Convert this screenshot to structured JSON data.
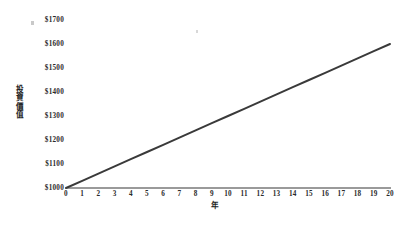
{
  "chart_data": {
    "type": "line",
    "title": "",
    "subtitle": "",
    "xlabel": "年",
    "ylabel": "投資價值",
    "ylabel_chars": [
      "投",
      "資",
      "價",
      "值"
    ],
    "x": [
      0,
      1,
      2,
      3,
      4,
      5,
      6,
      7,
      8,
      9,
      10,
      11,
      12,
      13,
      14,
      15,
      16,
      17,
      18,
      19,
      20
    ],
    "series": [
      {
        "name": "投資價值",
        "color": "#3a3a3a",
        "values": [
          1000,
          1030,
          1060,
          1090,
          1120,
          1150,
          1180,
          1210,
          1240,
          1270,
          1300,
          1330,
          1360,
          1390,
          1420,
          1450,
          1480,
          1510,
          1540,
          1570,
          1600
        ]
      }
    ],
    "x_tick_labels": [
      "0",
      "1",
      "2",
      "3",
      "4",
      "5",
      "6",
      "7",
      "8",
      "9",
      "10",
      "11",
      "12",
      "13",
      "14",
      "15",
      "16",
      "17",
      "18",
      "19",
      "20"
    ],
    "y_tick_labels": [
      "$1700",
      "$1600",
      "$1500",
      "$1400",
      "$1300",
      "$1200",
      "$1100",
      "$1000"
    ],
    "y_tick_values": [
      1700,
      1600,
      1500,
      1400,
      1300,
      1200,
      1100,
      1000
    ],
    "xlim": [
      0,
      20
    ],
    "ylim": [
      1000,
      1700
    ],
    "grid": false,
    "legend": false,
    "legend_position": "none",
    "axis_color": "#9a9a9a",
    "background_color": "#ffffff",
    "text_color": "#2a2a2a"
  }
}
